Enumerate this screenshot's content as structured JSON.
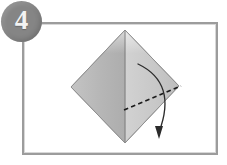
{
  "figure": {
    "type": "origami-instruction-diagram",
    "step_number": "4",
    "caption": "",
    "colors": {
      "badge_fill": "#858585",
      "badge_text": "#f2f2f2",
      "frame_border": "#9c9c9c",
      "paper_left_face": "#b6b6b6",
      "paper_right_face": "#c9c9c9",
      "paper_outline": "#8f8f8f",
      "crease_line": "#8a8a8a",
      "fold_dash_line": "#1b1b1b",
      "arrow": "#2b2b2b",
      "background": "#ffffff"
    }
  },
  "badge": {
    "label": "4",
    "name": "step-number-badge"
  },
  "diagram": {
    "shape": {
      "name": "diamond-paper",
      "vertices": {
        "top": [
          103,
          8
        ],
        "right": [
          157,
          64
        ],
        "bottom": [
          103,
          121
        ],
        "left": [
          49,
          65
        ]
      }
    },
    "center_crease": {
      "name": "vertical-center-crease",
      "from": [
        103,
        8
      ],
      "to": [
        103,
        121
      ]
    },
    "fold_line": {
      "name": "dashed-fold-line",
      "style": "dashed",
      "from": [
        103,
        88
      ],
      "to": [
        158,
        65
      ]
    },
    "arrow": {
      "name": "fold-direction-arrow",
      "style": "curved-solid-with-solid-head",
      "start": [
        116,
        42
      ],
      "control": [
        152,
        74
      ],
      "end": [
        137,
        110
      ],
      "head_tip": [
        137,
        116
      ]
    }
  },
  "caption_strip": {
    "text": ""
  }
}
